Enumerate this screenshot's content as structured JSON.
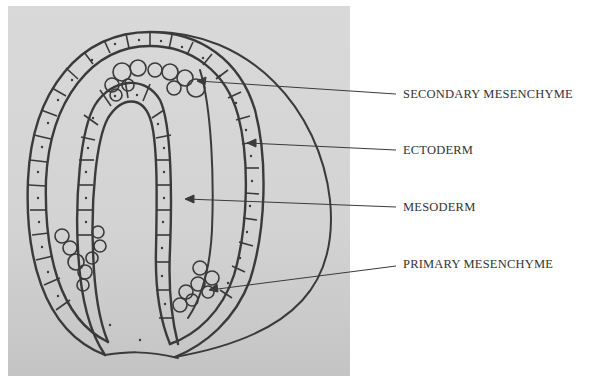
{
  "diagram": {
    "colors": {
      "background": "#ffffff",
      "panel": "#d6d6d6",
      "stroke": "#3a3a3a",
      "label_text": "#333333"
    },
    "labels": [
      {
        "id": "secondary-mesenchyme",
        "text": "SECONDARY MESENCHYME",
        "x": 403,
        "y": 87
      },
      {
        "id": "ectoderm",
        "text": "ECTODERM",
        "x": 403,
        "y": 143
      },
      {
        "id": "mesoderm",
        "text": "MESODERM",
        "x": 403,
        "y": 200
      },
      {
        "id": "primary-mesenchyme",
        "text": "PRIMARY MESENCHYME",
        "x": 403,
        "y": 257
      }
    ]
  }
}
